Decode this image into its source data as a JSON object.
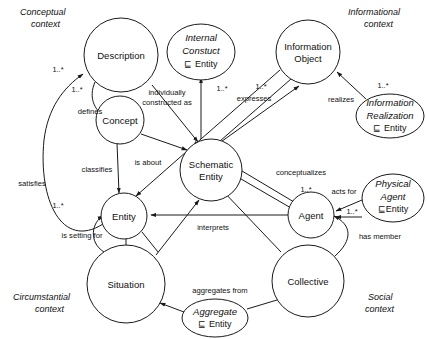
{
  "diagram": {
    "background_color": "#ffffff",
    "stroke_color": "#1a1a1a",
    "text_color": "#111111",
    "subsumption_symbol": "⊑",
    "multiplicity": "1..*",
    "context_labels": [
      {
        "id": "conceptual",
        "line1": "Conceptual",
        "line2": "context"
      },
      {
        "id": "informational",
        "line1": "Informational",
        "line2": "context"
      },
      {
        "id": "circumstantial",
        "line1": "Circumstantial",
        "line2": "context"
      },
      {
        "id": "social",
        "line1": "Social",
        "line2": "context"
      }
    ],
    "nodes": [
      {
        "id": "description",
        "label_line1": "Description",
        "label_line2": "",
        "shape": "circle",
        "style": "plain"
      },
      {
        "id": "concept",
        "label_line1": "Concept",
        "label_line2": "",
        "shape": "circle",
        "style": "plain"
      },
      {
        "id": "entity",
        "label_line1": "Entity",
        "label_line2": "",
        "shape": "circle",
        "style": "plain"
      },
      {
        "id": "situation",
        "label_line1": "Situation",
        "label_line2": "",
        "shape": "circle",
        "style": "plain"
      },
      {
        "id": "schematic-entity",
        "label_line1": "Schematic",
        "label_line2": "Entity",
        "shape": "circle",
        "style": "plain"
      },
      {
        "id": "information-object",
        "label_line1": "Information",
        "label_line2": "Object",
        "shape": "circle",
        "style": "plain"
      },
      {
        "id": "agent",
        "label_line1": "Agent",
        "label_line2": "",
        "shape": "circle",
        "style": "plain"
      },
      {
        "id": "collective",
        "label_line1": "Collective",
        "label_line2": "",
        "shape": "circle",
        "style": "plain"
      },
      {
        "id": "internal-constuct",
        "label_line1": "Internal",
        "label_line2": "Constuct",
        "label_line3": "⊑ Entity",
        "shape": "ellipse",
        "style": "italic"
      },
      {
        "id": "information-realization",
        "label_line1": "Information",
        "label_line2": "Realization",
        "label_line3": "⊑ Entity",
        "shape": "ellipse",
        "style": "italic"
      },
      {
        "id": "physical-agent",
        "label_line1": "Physical",
        "label_line2": "Agent",
        "label_line3": "⊑Entity",
        "shape": "ellipse",
        "style": "italic"
      },
      {
        "id": "aggregate",
        "label_line1": "Aggregate",
        "label_line2": "⊑ Entity",
        "label_line3": "",
        "shape": "ellipse",
        "style": "italic"
      }
    ],
    "edge_labels": [
      {
        "id": "defines",
        "text": "defines"
      },
      {
        "id": "classifies",
        "text": "classifies"
      },
      {
        "id": "is-about",
        "text": "is about"
      },
      {
        "id": "satisfies",
        "text": "satisfies"
      },
      {
        "id": "is-setting-for",
        "text": "is setting for"
      },
      {
        "id": "individually-constructed-as-1",
        "text": "individually"
      },
      {
        "id": "individually-constructed-as-2",
        "text": "constructed as"
      },
      {
        "id": "expresses",
        "text": "expresses"
      },
      {
        "id": "realizes",
        "text": "realizes"
      },
      {
        "id": "conceptualizes",
        "text": "conceptualizes"
      },
      {
        "id": "acts-for",
        "text": "acts for"
      },
      {
        "id": "has-member",
        "text": "has member"
      },
      {
        "id": "interprets",
        "text": "interprets"
      },
      {
        "id": "aggregates-from",
        "text": "aggregates from"
      }
    ],
    "multiplicity_labels": [
      {
        "id": "mult-satisfies",
        "text": "1..*"
      },
      {
        "id": "mult-defines",
        "text": "1..*"
      },
      {
        "id": "mult-internal-constuct",
        "text": "1..*"
      },
      {
        "id": "mult-expresses",
        "text": "1..*"
      },
      {
        "id": "mult-realizes",
        "text": "1..*"
      },
      {
        "id": "mult-is-setting-for",
        "text": "1..*"
      },
      {
        "id": "mult-conceptualizes",
        "text": "1..*"
      },
      {
        "id": "mult-acts-for",
        "text": "1..*"
      }
    ]
  }
}
